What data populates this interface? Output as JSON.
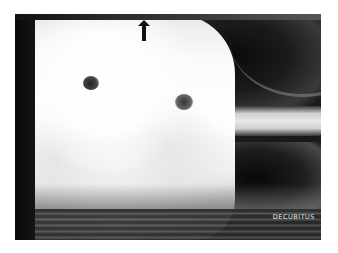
{
  "image": {
    "type": "radiograph",
    "view_label": "DECUBITUS",
    "annotation": {
      "shape": "arrow",
      "direction": "up"
    },
    "colors": {
      "background": "#ffffff",
      "film_dark": "#1a1a1a",
      "label_text": "#e8e8e8"
    }
  }
}
